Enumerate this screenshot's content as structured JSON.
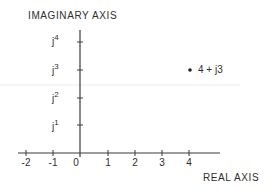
{
  "diagram": {
    "imag_axis_label": "IMAGINARY  AXIS",
    "real_axis_label": "REAL  AXIS",
    "x_ticks": [
      {
        "label": "-2",
        "value": -2,
        "px": 26
      },
      {
        "label": "-1",
        "value": -1,
        "px": 53
      },
      {
        "label": "0",
        "value": 0,
        "px": 76
      },
      {
        "label": "1",
        "value": 1,
        "px": 108
      },
      {
        "label": "2",
        "value": 2,
        "px": 135
      },
      {
        "label": "3",
        "value": 3,
        "px": 162
      },
      {
        "label": "4",
        "value": 4,
        "px": 189
      }
    ],
    "y_ticks": [
      {
        "prefix": "j",
        "label": "1",
        "value": 1,
        "px": 125
      },
      {
        "prefix": "j",
        "label": "2",
        "value": 2,
        "px": 98
      },
      {
        "prefix": "j",
        "label": "3",
        "value": 3,
        "px": 70
      },
      {
        "prefix": "j",
        "label": "4",
        "value": 4,
        "px": 42
      }
    ],
    "point": {
      "real": 4,
      "imag": 3,
      "label": "4 + j3"
    },
    "colors": {
      "ink": "#2e2e2e",
      "background": "#ffffff",
      "artifact": "#e8e8e8"
    }
  }
}
